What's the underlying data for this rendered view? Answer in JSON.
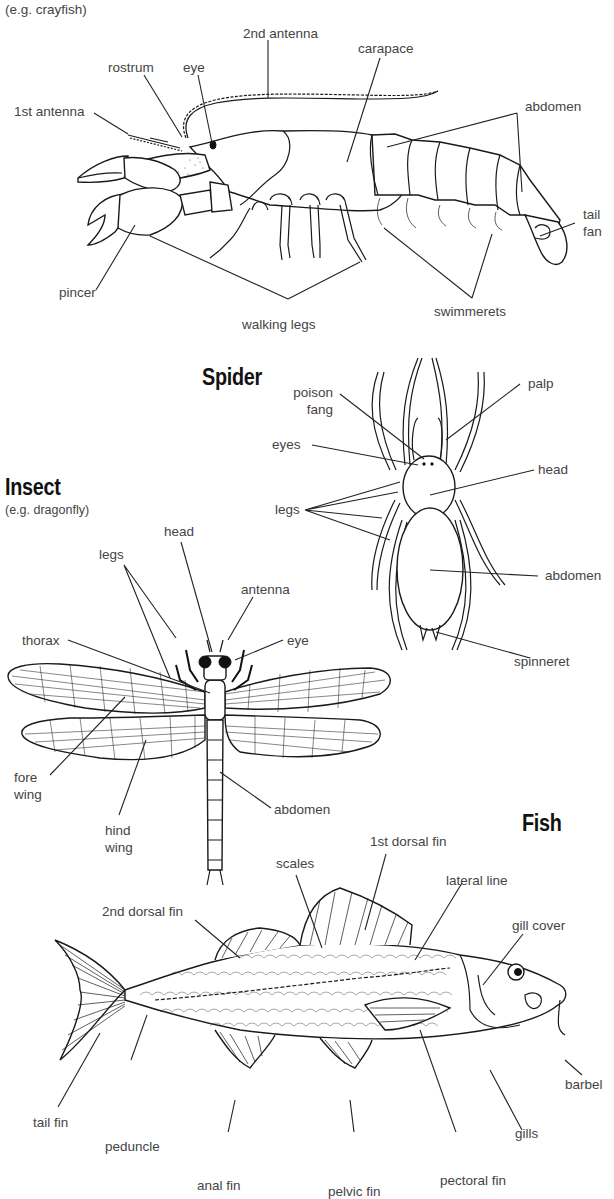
{
  "diagram": {
    "sections": {
      "crustacean": {
        "subtitle": "(e.g. crayfish)",
        "labels": {
          "second_antenna": "2nd antenna",
          "carapace": "carapace",
          "rostrum": "rostrum",
          "eye": "eye",
          "first_antenna": "1st antenna",
          "abdomen": "abdomen",
          "tail_fan_1": "tail",
          "tail_fan_2": "fan",
          "pincer": "pincer",
          "walking_legs": "walking legs",
          "swimmerets": "swimmerets"
        }
      },
      "spider": {
        "title": "Spider",
        "labels": {
          "poison_fang_1": "poison",
          "poison_fang_2": "fang",
          "palp": "palp",
          "eyes": "eyes",
          "head": "head",
          "legs": "legs",
          "abdomen": "abdomen",
          "spinneret": "spinneret"
        }
      },
      "insect": {
        "title": "Insect",
        "subtitle": "(e.g. dragonfly)",
        "labels": {
          "head": "head",
          "legs": "legs",
          "antenna": "antenna",
          "thorax": "thorax",
          "eye": "eye",
          "fore_wing_1": "fore",
          "fore_wing_2": "wing",
          "hind_wing_1": "hind",
          "hind_wing_2": "wing",
          "abdomen": "abdomen"
        }
      },
      "fish": {
        "title": "Fish",
        "labels": {
          "first_dorsal_fin": "1st dorsal fin",
          "scales": "scales",
          "lateral_line": "lateral line",
          "second_dorsal_fin": "2nd dorsal fin",
          "gill_cover": "gill cover",
          "barbel": "barbel",
          "tail_fin": "tail fin",
          "peduncle": "peduncle",
          "gills": "gills",
          "pectoral_fin": "pectoral fin",
          "anal_fin": "anal fin",
          "pelvic_fin": "pelvic fin"
        }
      }
    }
  }
}
